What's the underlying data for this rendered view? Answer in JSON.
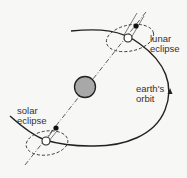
{
  "diagram": {
    "labels": {
      "lunar_eclipse": [
        "lunar",
        "eclipse"
      ],
      "solar_eclipse": [
        "solar",
        "eclipse"
      ],
      "earths_orbit": [
        "earth's",
        "orbit"
      ]
    },
    "colors": {
      "line": "#222222",
      "sun_fill": "#a8a8a8",
      "background": "#f7f7f5"
    }
  }
}
